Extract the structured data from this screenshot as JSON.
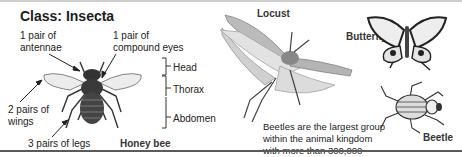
{
  "title": "Class: Insecta",
  "honeybee": {
    "name": "Honey bee",
    "labels": {
      "antennae": [
        "1 pair of",
        "antennae"
      ],
      "eyes": [
        "1 pair of",
        "compound eyes"
      ],
      "wings": [
        "2 pairs of",
        "wings"
      ],
      "legs": "3 pairs of legs"
    },
    "body_parts": [
      "Head",
      "Thorax",
      "Abdomen"
    ]
  },
  "locust": {
    "name": "Locust"
  },
  "butterfly": {
    "name": "Butterfly"
  },
  "beetle": {
    "name": "Beetle",
    "fact": "Beetles are the largest group within the animal kingdom with more than 300,000 species."
  },
  "colors": {
    "text": "#222222",
    "illustration": "#555555",
    "bottom_rule": "#5a5a5a"
  }
}
